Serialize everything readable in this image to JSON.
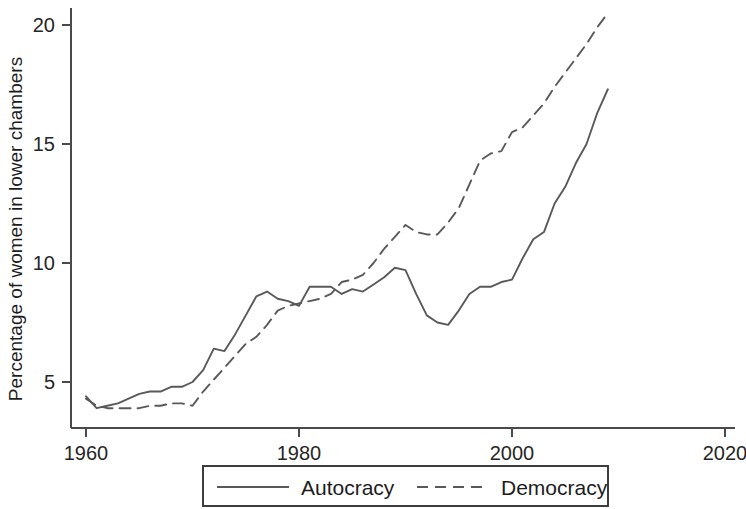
{
  "chart_data": {
    "type": "line",
    "title": "",
    "subtitle": "",
    "xlabel": "",
    "ylabel": "Percentage of women in lower chambers",
    "xlim": [
      1960,
      2020
    ],
    "ylim": [
      3.3,
      20.9
    ],
    "xticks": [
      1960,
      1980,
      2000,
      2020
    ],
    "xticklabels": [
      "1960",
      "1980",
      "2000",
      "2020"
    ],
    "yticks": [
      5,
      10,
      15,
      20
    ],
    "yticklabels": [
      "5",
      "10",
      "15",
      "20"
    ],
    "grid": false,
    "legend_position": "bottom-center",
    "x": [
      1960,
      1961,
      1962,
      1963,
      1964,
      1965,
      1966,
      1967,
      1968,
      1969,
      1970,
      1971,
      1972,
      1973,
      1974,
      1975,
      1976,
      1977,
      1978,
      1979,
      1980,
      1981,
      1982,
      1983,
      1984,
      1985,
      1986,
      1987,
      1988,
      1989,
      1990,
      1991,
      1992,
      1993,
      1994,
      1995,
      1996,
      1997,
      1998,
      1999,
      2000,
      2001,
      2002,
      2003,
      2004,
      2005,
      2006,
      2007,
      2008,
      2009
    ],
    "series": [
      {
        "name": "Autocracy",
        "style": "solid",
        "values": [
          4.4,
          3.9,
          4.0,
          4.1,
          4.3,
          4.5,
          4.6,
          4.6,
          4.8,
          4.8,
          5.0,
          5.5,
          6.4,
          6.3,
          7.0,
          7.8,
          8.6,
          8.8,
          8.5,
          8.4,
          8.2,
          9.0,
          9.0,
          9.0,
          8.7,
          8.9,
          8.8,
          9.1,
          9.4,
          9.8,
          9.7,
          8.7,
          7.8,
          7.5,
          7.4,
          8.0,
          8.7,
          9.0,
          9.0,
          9.2,
          9.3,
          10.2,
          11.0,
          11.3,
          12.5,
          13.2,
          14.2,
          15.0,
          16.3,
          17.3
        ]
      },
      {
        "name": "Democracy",
        "style": "dashed",
        "values": [
          4.3,
          4.0,
          3.9,
          3.9,
          3.9,
          3.9,
          4.0,
          4.0,
          4.1,
          4.1,
          4.0,
          4.6,
          5.1,
          5.6,
          6.1,
          6.6,
          6.9,
          7.4,
          8.0,
          8.2,
          8.3,
          8.4,
          8.5,
          8.7,
          9.2,
          9.3,
          9.5,
          10.0,
          10.6,
          11.1,
          11.6,
          11.3,
          11.2,
          11.2,
          11.7,
          12.3,
          13.3,
          14.3,
          14.6,
          14.7,
          15.5,
          15.7,
          16.2,
          16.7,
          17.4,
          18.0,
          18.6,
          19.2,
          19.9,
          20.5
        ]
      }
    ],
    "legend": [
      {
        "label": "Autocracy",
        "style": "solid"
      },
      {
        "label": "Democracy",
        "style": "dashed"
      }
    ],
    "colors": {
      "line": "#59595c",
      "axis": "#4a4a4a",
      "text": "#1d1d1d",
      "background": "#ffffff"
    }
  }
}
